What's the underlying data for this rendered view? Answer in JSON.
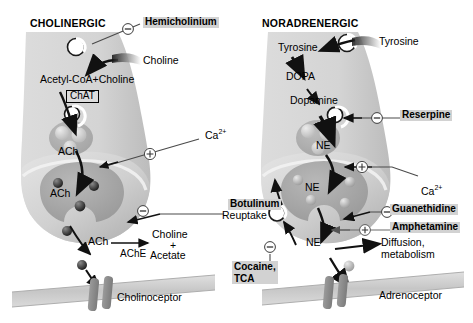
{
  "figure": {
    "title_left": "CHOLINERGIC",
    "title_right": "NORADRENERGIC"
  },
  "cholinergic": {
    "uptake_substrate": "Choline",
    "synthesis": "Acetyl-CoA+Choline",
    "enzyme_synth": "ChAT",
    "vesicle_label": "ACh",
    "terminal_label": "ACh",
    "released_label": "ACh",
    "degrading_enzyme": "AChE",
    "metabolites_line1": "Choline",
    "metabolites_line2": "+",
    "metabolites_line3": "Acetate",
    "receptor": "Cholinoceptor",
    "calcium": "Ca",
    "calcium_charge": "2+",
    "drugs": [
      {
        "name": "Hemicholinium",
        "sign": "−"
      },
      {
        "name": "Botulinum",
        "sign": "−"
      }
    ]
  },
  "noradrenergic": {
    "uptake_substrate": "Tyrosine",
    "step1": "Tyrosine",
    "step2": "DOPA",
    "step3": "Dopamine",
    "vesicle_label": "NE",
    "terminal_label": "NE",
    "released_label": "NE",
    "reuptake_label": "Reuptake",
    "fate_line1": "Diffusion,",
    "fate_line2": "metabolism",
    "receptor": "Adrenoceptor",
    "calcium": "Ca",
    "calcium_charge": "2+",
    "drugs": [
      {
        "name": "Reserpine",
        "sign": "−"
      },
      {
        "name": "Guanethidine",
        "sign": "−"
      },
      {
        "name": "Amphetamine",
        "sign": "+"
      },
      {
        "name": "Cocaine,",
        "name2": "TCA",
        "sign": "−"
      }
    ]
  },
  "signs": {
    "plus": "+",
    "minus": "−"
  },
  "colors": {
    "neuron_fill": "#d8d8d8",
    "neuron_fill_dark": "#bdbdbd",
    "vesicle_pool": "#a9a9a9",
    "membrane": "#c8c8c8",
    "receptor": "#8e8e8e",
    "highlight": "#d2d2d2",
    "stroke": "#1a1a1a"
  }
}
